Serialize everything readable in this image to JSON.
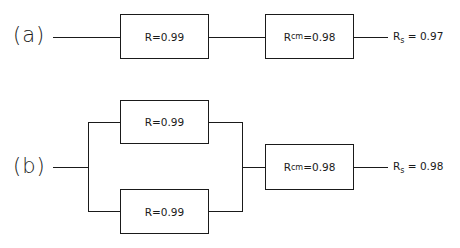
{
  "diagram": {
    "a": {
      "label": "(a)",
      "block1": {
        "symbol": "R",
        "sub": "",
        "value": "=0.99"
      },
      "block2": {
        "symbol": "R",
        "sub": "cm",
        "value": "=0.98"
      },
      "result": {
        "symbol": "R",
        "sub": "s",
        "value": " = 0.97"
      }
    },
    "b": {
      "label": "(b)",
      "block_upper": {
        "symbol": "R",
        "sub": "",
        "value": "=0.99"
      },
      "block_lower": {
        "symbol": "R",
        "sub": "",
        "value": "=0.99"
      },
      "block_cm": {
        "symbol": "R",
        "sub": "cm",
        "value": "=0.98"
      },
      "result": {
        "symbol": "R",
        "sub": "s",
        "value": " = 0.98"
      }
    }
  }
}
